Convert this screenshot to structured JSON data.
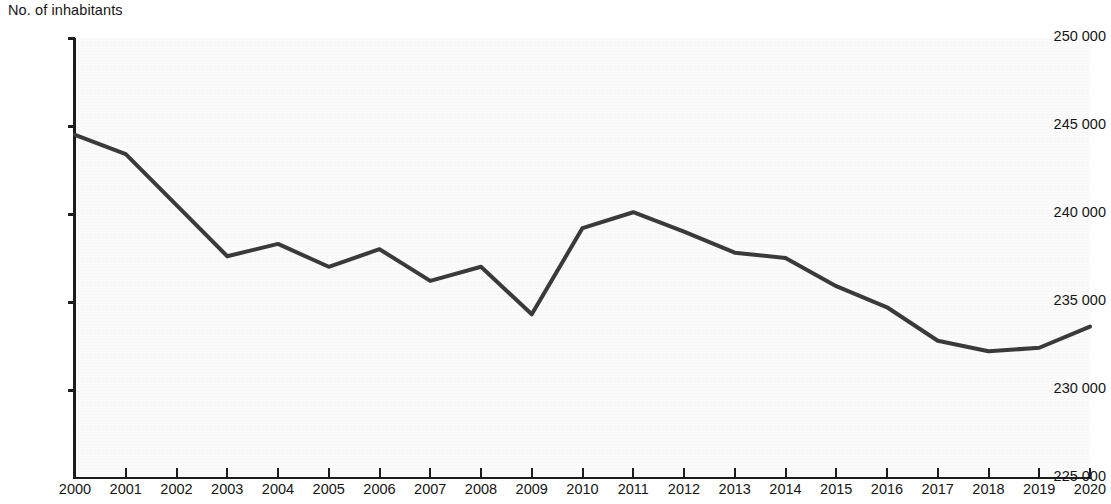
{
  "chart_data": {
    "type": "line",
    "title": "",
    "subtitle": "",
    "ylabel": "No. of inhabitants",
    "xlabel": "",
    "ylim": [
      225000,
      250000
    ],
    "ytick_step": 5000,
    "ytick_labels": [
      "250 000",
      "245 000",
      "240 000",
      "235 000",
      "230 000",
      "225 000"
    ],
    "ytick_values": [
      250000,
      245000,
      240000,
      235000,
      230000,
      225000
    ],
    "grid": false,
    "legend": "none",
    "line_color": "#3a3a3a",
    "line_width": 4,
    "categories": [
      "2000",
      "2001",
      "2002",
      "2003",
      "2004",
      "2005",
      "2006",
      "2007",
      "2008",
      "2009",
      "2010",
      "2011",
      "2012",
      "2013",
      "2014",
      "2015",
      "2016",
      "2017",
      "2018",
      "2019",
      "2020"
    ],
    "series": [
      {
        "name": "No. of inhabitants",
        "values": [
          244500,
          243400,
          240500,
          237600,
          238300,
          237000,
          238000,
          236200,
          237000,
          234300,
          239200,
          240100,
          239000,
          237800,
          237500,
          235900,
          234700,
          232800,
          232200,
          232400,
          233600
        ]
      }
    ]
  },
  "axes": {
    "y_title": "No. of inhabitants"
  }
}
